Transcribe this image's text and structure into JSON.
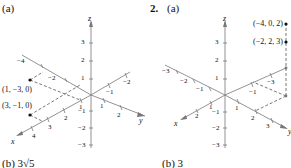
{
  "figure1": {
    "part_label": "(a)",
    "bottom_label": "(b)  3√5",
    "axes": {
      "x": "x",
      "y": "y",
      "z": "z"
    },
    "z_ticks": [
      "3",
      "2",
      "1",
      "−1",
      "−2",
      "−3"
    ],
    "x_ticks": [
      "−4",
      "−2",
      "1",
      "2",
      "3",
      "4"
    ],
    "y_ticks": [
      "−2",
      "−1",
      "1",
      "2"
    ],
    "points": [
      {
        "label": "(1, −3, 0)"
      },
      {
        "label": "(3, −1, 0)"
      }
    ]
  },
  "figure2": {
    "number": "2.",
    "part_label": "(a)",
    "bottom_label": "(b)  3",
    "axes": {
      "x": "x",
      "y": "y",
      "z": "z"
    },
    "z_ticks": [
      "3",
      "2",
      "1",
      "−1",
      "−2",
      "−3"
    ],
    "x_ticks": [
      "−3",
      "−2",
      "−1",
      "1",
      "2"
    ],
    "y_ticks": [
      "−3",
      "−1",
      "1",
      "2",
      "3"
    ],
    "points": [
      {
        "label": "(−4, 0, 2)"
      },
      {
        "label": "(−2, 2, 3)"
      }
    ]
  }
}
